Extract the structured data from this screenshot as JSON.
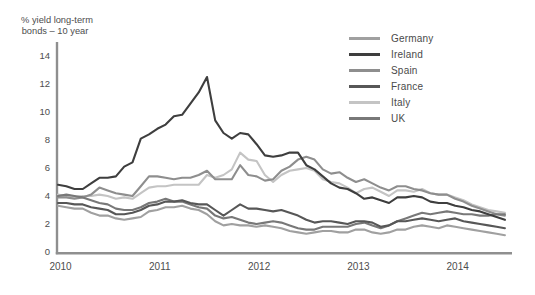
{
  "chart_data": {
    "type": "line",
    "ylabel_line1": "% yield long-term",
    "ylabel_line2": "bonds – 10 year",
    "xlabel": "",
    "x_start": 2010.0,
    "x_step": 0.08333,
    "x_end": 2014.5,
    "xticks": [
      2010,
      2011,
      2012,
      2013,
      2014
    ],
    "yticks": [
      0,
      2,
      4,
      6,
      8,
      10,
      12,
      14
    ],
    "ylim": [
      0,
      14
    ],
    "grid": false,
    "legend_position": "top-right",
    "axis_color": "#8f8f8f",
    "label_color": "#4d4d4d",
    "series": [
      {
        "name": "Germany",
        "color": "#a0a0a0",
        "values": [
          3.3,
          3.2,
          3.1,
          3.1,
          2.8,
          2.6,
          2.6,
          2.4,
          2.3,
          2.4,
          2.5,
          2.9,
          3.0,
          3.2,
          3.2,
          3.3,
          3.1,
          3.0,
          2.7,
          2.2,
          1.9,
          2.0,
          1.9,
          1.9,
          1.8,
          1.9,
          1.8,
          1.7,
          1.5,
          1.4,
          1.3,
          1.4,
          1.5,
          1.5,
          1.4,
          1.4,
          1.6,
          1.6,
          1.4,
          1.3,
          1.4,
          1.6,
          1.6,
          1.8,
          1.9,
          1.8,
          1.7,
          1.9,
          1.8,
          1.7,
          1.6,
          1.5,
          1.4,
          1.3,
          1.2
        ]
      },
      {
        "name": "Ireland",
        "color": "#3e3e3e",
        "values": [
          4.8,
          4.7,
          4.5,
          4.5,
          4.9,
          5.3,
          5.3,
          5.4,
          6.1,
          6.4,
          8.1,
          8.4,
          8.8,
          9.1,
          9.7,
          9.8,
          10.6,
          11.4,
          12.5,
          9.4,
          8.5,
          8.1,
          8.5,
          8.4,
          7.7,
          6.9,
          6.8,
          6.9,
          7.1,
          7.1,
          6.2,
          5.9,
          5.4,
          4.9,
          4.6,
          4.5,
          4.2,
          3.8,
          3.9,
          3.7,
          3.5,
          3.9,
          3.9,
          4.0,
          3.9,
          3.6,
          3.5,
          3.5,
          3.3,
          3.2,
          3.0,
          2.9,
          2.7,
          2.5,
          2.3
        ]
      },
      {
        "name": "Spain",
        "color": "#8e8e8e",
        "values": [
          3.9,
          3.9,
          3.8,
          3.9,
          4.1,
          4.6,
          4.4,
          4.2,
          4.1,
          4.0,
          4.7,
          5.4,
          5.4,
          5.3,
          5.2,
          5.3,
          5.3,
          5.5,
          5.8,
          5.2,
          5.2,
          5.2,
          6.2,
          5.5,
          5.4,
          5.1,
          5.2,
          5.8,
          6.1,
          6.6,
          6.8,
          6.6,
          5.9,
          5.6,
          5.7,
          5.3,
          5.0,
          5.2,
          4.9,
          4.6,
          4.4,
          4.7,
          4.7,
          4.5,
          4.4,
          4.2,
          4.1,
          4.1,
          3.8,
          3.6,
          3.3,
          3.1,
          2.9,
          2.7,
          2.6
        ]
      },
      {
        "name": "France",
        "color": "#575757",
        "values": [
          3.5,
          3.5,
          3.4,
          3.4,
          3.2,
          3.1,
          3.0,
          2.7,
          2.7,
          2.8,
          3.0,
          3.3,
          3.4,
          3.6,
          3.6,
          3.7,
          3.5,
          3.4,
          3.4,
          3.0,
          2.6,
          3.0,
          3.4,
          3.1,
          3.1,
          3.0,
          2.9,
          3.0,
          2.8,
          2.6,
          2.3,
          2.1,
          2.2,
          2.2,
          2.1,
          2.0,
          2.2,
          2.2,
          2.1,
          1.8,
          1.9,
          2.2,
          2.2,
          2.3,
          2.4,
          2.3,
          2.2,
          2.3,
          2.4,
          2.2,
          2.1,
          2.0,
          1.9,
          1.8,
          1.7
        ]
      },
      {
        "name": "Italy",
        "color": "#c4c4c4",
        "values": [
          4.1,
          4.0,
          3.9,
          4.0,
          4.0,
          4.1,
          4.0,
          3.8,
          3.9,
          3.8,
          4.2,
          4.6,
          4.7,
          4.7,
          4.8,
          4.8,
          4.8,
          4.8,
          5.5,
          5.3,
          5.5,
          5.9,
          7.1,
          6.6,
          6.5,
          5.5,
          5.0,
          5.5,
          5.8,
          5.9,
          6.0,
          5.8,
          5.2,
          5.0,
          4.9,
          4.6,
          4.2,
          4.5,
          4.6,
          4.3,
          4.0,
          4.4,
          4.4,
          4.3,
          4.5,
          4.2,
          4.1,
          4.1,
          3.9,
          3.7,
          3.4,
          3.2,
          3.0,
          2.9,
          2.8
        ]
      },
      {
        "name": "UK",
        "color": "#787878",
        "values": [
          4.0,
          4.1,
          4.0,
          3.9,
          3.7,
          3.5,
          3.4,
          3.1,
          3.0,
          3.0,
          3.2,
          3.5,
          3.6,
          3.8,
          3.6,
          3.6,
          3.4,
          3.2,
          3.1,
          2.6,
          2.4,
          2.5,
          2.3,
          2.1,
          2.0,
          2.1,
          2.2,
          2.1,
          1.9,
          1.7,
          1.6,
          1.6,
          1.8,
          1.8,
          1.8,
          1.8,
          2.0,
          2.1,
          1.9,
          1.7,
          1.9,
          2.2,
          2.4,
          2.6,
          2.8,
          2.7,
          2.8,
          2.9,
          2.8,
          2.7,
          2.7,
          2.6,
          2.6,
          2.7,
          2.7
        ]
      }
    ]
  }
}
